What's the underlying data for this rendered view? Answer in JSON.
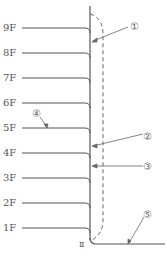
{
  "diagram": {
    "floors": [
      {
        "label": "9F",
        "y": 28
      },
      {
        "label": "8F",
        "y": 53
      },
      {
        "label": "7F",
        "y": 78
      },
      {
        "label": "6F",
        "y": 103
      },
      {
        "label": "5F",
        "y": 128
      },
      {
        "label": "4F",
        "y": 153
      },
      {
        "label": "3F",
        "y": 178
      },
      {
        "label": "2F",
        "y": 203
      },
      {
        "label": "1F",
        "y": 228
      }
    ],
    "callouts": [
      {
        "id": "1",
        "label": "①"
      },
      {
        "id": "2",
        "label": "②"
      },
      {
        "id": "3",
        "label": "③"
      },
      {
        "id": "4",
        "label": "④"
      },
      {
        "id": "5",
        "label": "⑤"
      }
    ],
    "ground_marker": "Ⅱ",
    "colors": {
      "line": "#555555",
      "dashed": "#666666",
      "text": "#555555"
    }
  }
}
